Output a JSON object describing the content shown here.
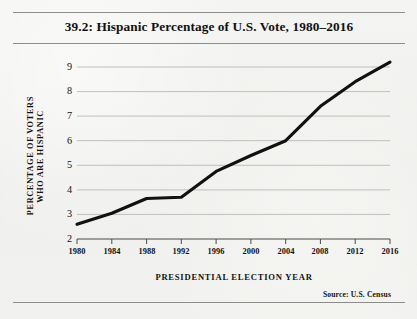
{
  "figure": {
    "title": "39.2: Hispanic Percentage of U.S. Vote, 1980–2016",
    "source": "Source:  U.S. Census"
  },
  "chart_data": {
    "type": "line",
    "title": "39.2: Hispanic Percentage of U.S. Vote, 1980–2016",
    "subtitle": "",
    "xlabel": "PRESIDENTIAL ELECTION YEAR",
    "ylabel_line1": "PERCENTAGE OF VOTERS",
    "ylabel_line2": "WHO ARE HISPANIC",
    "x": [
      1980,
      1984,
      1988,
      1992,
      1996,
      2000,
      2004,
      2008,
      2012,
      2016
    ],
    "xtick_labels": [
      "1980",
      "1984",
      "1988",
      "1992",
      "1996",
      "2000",
      "2004",
      "2008",
      "2012",
      "2016"
    ],
    "values": [
      2.6,
      3.05,
      3.65,
      3.7,
      4.75,
      5.4,
      6.0,
      7.4,
      8.4,
      9.2
    ],
    "ytick_labels": [
      "9",
      "8",
      "7",
      "6",
      "5",
      "4",
      "3",
      "2"
    ],
    "yticks": [
      9,
      8,
      7,
      6,
      5,
      4,
      3,
      2
    ],
    "ylim": [
      2,
      9
    ],
    "xlim": [
      1980,
      2016
    ],
    "grid": "horizontal",
    "legend": "none",
    "series_name": "Percentage of voters who are Hispanic",
    "line_color": "#111111",
    "grid_color": "#b9b9b7",
    "background_color": "#f1f1ef",
    "annotations": []
  }
}
